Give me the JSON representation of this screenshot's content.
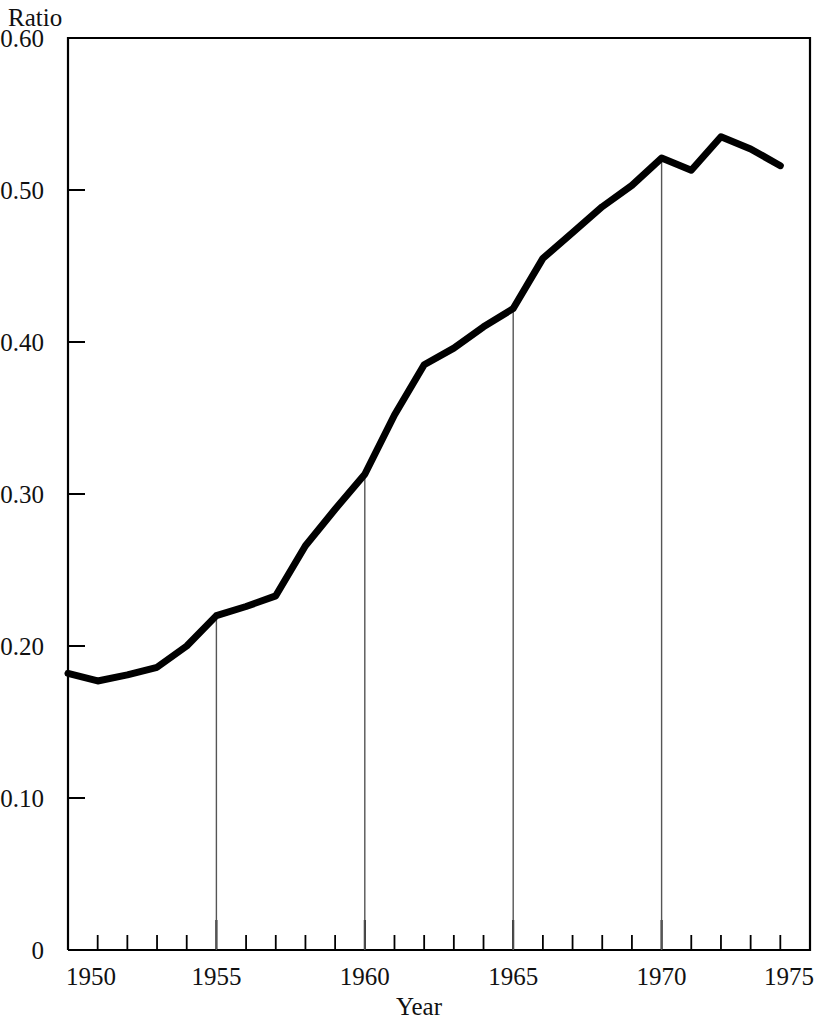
{
  "chart_data": {
    "type": "line",
    "title": "",
    "subtitle": "",
    "xlabel": "Year",
    "ylabel": "Ratio",
    "ylabel_position": "top-left",
    "xlim": [
      1950,
      1975
    ],
    "ylim": [
      0,
      0.6
    ],
    "grid": false,
    "legend": null,
    "y_ticks": [
      0,
      0.1,
      0.2,
      0.3,
      0.4,
      0.5,
      0.6
    ],
    "y_tick_labels": [
      "0",
      "0.10",
      "0.20",
      "0.30",
      "0.40",
      "0.50",
      "0.60"
    ],
    "x_ticks": [
      1950,
      1955,
      1960,
      1965,
      1970,
      1975
    ],
    "x_tick_labels": [
      "1950",
      "1955",
      "1960",
      "1965",
      "1970",
      "1975"
    ],
    "x_minor_tick_interval": 1,
    "series": [
      {
        "name": "Ratio",
        "color": "#000000",
        "line_width": 7,
        "x": [
          1950,
          1951,
          1952,
          1953,
          1954,
          1955,
          1956,
          1957,
          1958,
          1959,
          1960,
          1961,
          1962,
          1963,
          1964,
          1965,
          1966,
          1967,
          1968,
          1969,
          1970,
          1971,
          1972,
          1973,
          1974
        ],
        "values": [
          0.182,
          0.177,
          0.181,
          0.186,
          0.2,
          0.22,
          0.226,
          0.233,
          0.266,
          0.29,
          0.313,
          0.352,
          0.385,
          0.396,
          0.41,
          0.422,
          0.455,
          0.472,
          0.489,
          0.503,
          0.521,
          0.513,
          0.535,
          0.527,
          0.516
        ]
      }
    ],
    "drop_lines": {
      "description": "thin vertical lines from curve down to x-axis",
      "x": [
        1955,
        1960,
        1965,
        1970
      ],
      "y_top": [
        0.22,
        0.313,
        0.422,
        0.521
      ],
      "color": "#555555"
    },
    "annotations": []
  },
  "figure": {
    "background": "#ffffff",
    "frame_color": "#000000",
    "axis_color": "#000000"
  }
}
